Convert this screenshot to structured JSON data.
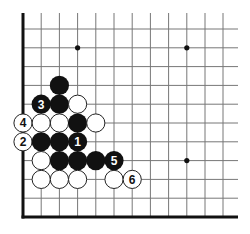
{
  "diagram": {
    "type": "go-board-corner",
    "corner": "bottom-left",
    "colors": {
      "black": "#111111",
      "white": "#ffffff",
      "line": "#777777",
      "edge": "#111111",
      "board": "#ffffff"
    },
    "grid": {
      "x": [
        23,
        41.2,
        59.4,
        77.6,
        95.8,
        114,
        132.2,
        150.4,
        168.6,
        186.8,
        205,
        223
      ],
      "y": [
        29,
        47.8,
        66.6,
        85.4,
        104.2,
        123,
        141.8,
        160.6,
        179.4,
        198.2,
        217
      ],
      "line_top": 13,
      "line_right": 238
    },
    "star_points": [
      {
        "col": 3,
        "row": 1
      },
      {
        "col": 9,
        "row": 1
      },
      {
        "col": 9,
        "row": 7
      }
    ],
    "stones": [
      {
        "color": "black",
        "col": 2,
        "row": 3,
        "label": ""
      },
      {
        "color": "black",
        "col": 1,
        "row": 4,
        "label": "3"
      },
      {
        "color": "black",
        "col": 2,
        "row": 4,
        "label": ""
      },
      {
        "color": "white",
        "col": 3,
        "row": 4,
        "label": ""
      },
      {
        "color": "white",
        "col": 0,
        "row": 5,
        "label": "4"
      },
      {
        "color": "white",
        "col": 1,
        "row": 5,
        "label": ""
      },
      {
        "color": "white",
        "col": 2,
        "row": 5,
        "label": ""
      },
      {
        "color": "black",
        "col": 3,
        "row": 5,
        "label": ""
      },
      {
        "color": "white",
        "col": 4,
        "row": 5,
        "label": ""
      },
      {
        "color": "white",
        "col": 0,
        "row": 6,
        "label": "2"
      },
      {
        "color": "black",
        "col": 1,
        "row": 6,
        "label": ""
      },
      {
        "color": "black",
        "col": 2,
        "row": 6,
        "label": ""
      },
      {
        "color": "black",
        "col": 3,
        "row": 6,
        "label": "1"
      },
      {
        "color": "white",
        "col": 1,
        "row": 7,
        "label": ""
      },
      {
        "color": "black",
        "col": 2,
        "row": 7,
        "label": ""
      },
      {
        "color": "black",
        "col": 3,
        "row": 7,
        "label": ""
      },
      {
        "color": "black",
        "col": 4,
        "row": 7,
        "label": ""
      },
      {
        "color": "black",
        "col": 5,
        "row": 7,
        "label": "5"
      },
      {
        "color": "white",
        "col": 1,
        "row": 8,
        "label": ""
      },
      {
        "color": "white",
        "col": 2,
        "row": 8,
        "label": ""
      },
      {
        "color": "white",
        "col": 3,
        "row": 8,
        "label": ""
      },
      {
        "color": "white",
        "col": 5,
        "row": 8,
        "label": ""
      },
      {
        "color": "white",
        "col": 6,
        "row": 8,
        "label": "6"
      }
    ],
    "move_labels": [
      "1",
      "2",
      "3",
      "4",
      "5",
      "6"
    ]
  }
}
